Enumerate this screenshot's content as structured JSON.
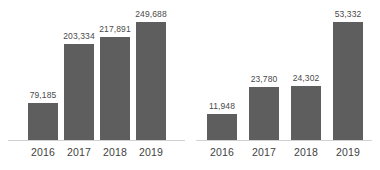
{
  "chart_data": [
    {
      "type": "bar",
      "title": "",
      "xlabel": "",
      "ylabel": "",
      "grid": false,
      "legend": "none",
      "categories": [
        "2016",
        "2017",
        "2018",
        "2019"
      ],
      "values": [
        79185,
        203334,
        217891,
        249688
      ],
      "value_labels": [
        "79,185",
        "203,334",
        "217,891",
        "249,688"
      ],
      "ylim": [
        0,
        249688
      ],
      "bar_color": "#5e5e5e",
      "label_color": "#4a4a4a",
      "axis_color": "#d2d2d2"
    },
    {
      "type": "bar",
      "title": "",
      "xlabel": "",
      "ylabel": "",
      "grid": false,
      "legend": "none",
      "categories": [
        "2016",
        "2017",
        "2018",
        "2019"
      ],
      "values": [
        11948,
        23780,
        24302,
        53332
      ],
      "value_labels": [
        "11,948",
        "23,780",
        "24,302",
        "53,332"
      ],
      "ylim": [
        0,
        53332
      ],
      "bar_color": "#5e5e5e",
      "label_color": "#4a4a4a",
      "axis_color": "#d2d2d2"
    }
  ]
}
